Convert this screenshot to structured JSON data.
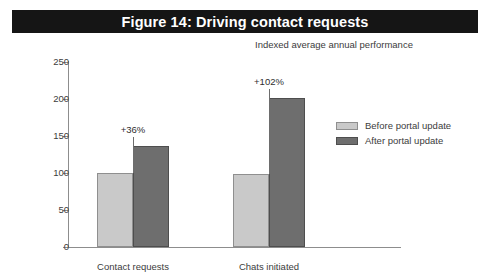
{
  "figure": {
    "title": "Figure 14: Driving contact requests",
    "subtitle": "Indexed average annual performance"
  },
  "legend": {
    "items": [
      {
        "label": "Before portal update",
        "color": "#c9c9c9",
        "key": "before"
      },
      {
        "label": "After portal update",
        "color": "#6e6e6e",
        "key": "after"
      }
    ]
  },
  "chart_data": {
    "type": "bar",
    "title": "Figure 14: Driving contact requests",
    "subtitle": "Indexed average annual performance",
    "categories": [
      "Contact requests",
      "Chats initiated"
    ],
    "series": [
      {
        "name": "Before portal update",
        "color": "#c9c9c9",
        "values": [
          100,
          98
        ]
      },
      {
        "name": "After portal update",
        "color": "#6e6e6e",
        "values": [
          136,
          201
        ]
      }
    ],
    "annotations": [
      "+36%",
      "+102%"
    ],
    "xlabel": "",
    "ylabel": "",
    "ylim": [
      0,
      250
    ],
    "yticks": [
      0,
      50,
      100,
      150,
      200,
      250
    ],
    "grid": false,
    "legend_position": "right"
  }
}
